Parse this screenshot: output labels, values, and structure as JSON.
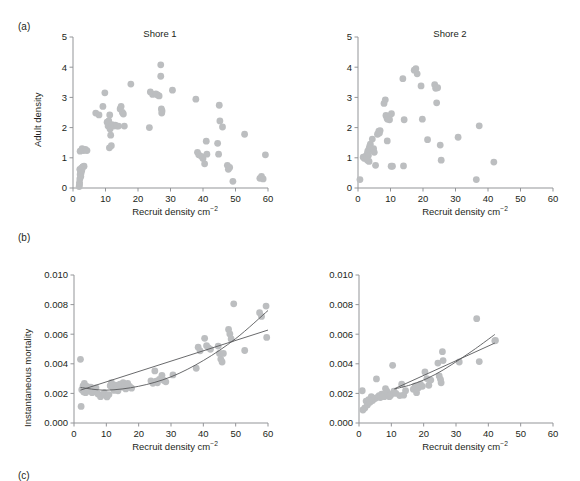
{
  "figure": {
    "panel_a_letter": "(a)",
    "panel_b_letter": "(b)",
    "panel_c_letter": "(c)"
  },
  "labels": {
    "title_shore1": "Shore 1",
    "title_shore2": "Shore 2",
    "xlabel": "Recruit density cm",
    "xlabel_sup": "−2",
    "ylabel_top": "Adult density",
    "ylabel_bottom": "Instantaneous mortality"
  },
  "colors": {
    "point": "#bcbec0",
    "axis": "#939598",
    "line": "#58595b",
    "text": "#231f20",
    "background": "#ffffff"
  },
  "chart_data": [
    {
      "id": "a-shore1",
      "type": "scatter",
      "title": "Shore 1",
      "xlabel": "Recruit density cm−2",
      "ylabel": "Adult density",
      "xlim": [
        0,
        60
      ],
      "ylim": [
        0,
        5
      ],
      "xticks": [
        0,
        10,
        20,
        30,
        40,
        50,
        60
      ],
      "yticks": [
        0,
        1,
        2,
        3,
        4,
        5
      ],
      "grid": false,
      "legend": "none",
      "points": [
        [
          1.9,
          0.05
        ],
        [
          2.0,
          0.18
        ],
        [
          2.1,
          0.3
        ],
        [
          2.2,
          0.45
        ],
        [
          2.3,
          0.55
        ],
        [
          2.1,
          0.62
        ],
        [
          2.6,
          0.66
        ],
        [
          3.0,
          0.7
        ],
        [
          3.4,
          0.72
        ],
        [
          2.5,
          0.5
        ],
        [
          2.0,
          0.12
        ],
        [
          2.4,
          0.38
        ],
        [
          2.7,
          0.58
        ],
        [
          3.1,
          0.7
        ],
        [
          2.2,
          1.22
        ],
        [
          2.8,
          1.3
        ],
        [
          3.3,
          1.24
        ],
        [
          3.8,
          1.28
        ],
        [
          4.3,
          1.24
        ],
        [
          7.0,
          2.48
        ],
        [
          8.0,
          2.42
        ],
        [
          9.2,
          2.7
        ],
        [
          9.8,
          3.15
        ],
        [
          10.5,
          2.18
        ],
        [
          10.8,
          2.05
        ],
        [
          11.0,
          2.22
        ],
        [
          11.3,
          2.42
        ],
        [
          11.4,
          1.95
        ],
        [
          11.6,
          1.75
        ],
        [
          11.2,
          1.33
        ],
        [
          11.8,
          1.4
        ],
        [
          12.0,
          2.1
        ],
        [
          12.5,
          2.05
        ],
        [
          13.0,
          2.08
        ],
        [
          13.5,
          2.05
        ],
        [
          14.0,
          2.05
        ],
        [
          14.5,
          2.62
        ],
        [
          14.8,
          2.7
        ],
        [
          15.2,
          2.5
        ],
        [
          15.5,
          2.45
        ],
        [
          15.8,
          2.05
        ],
        [
          17.8,
          3.44
        ],
        [
          23.5,
          2.0
        ],
        [
          23.8,
          3.18
        ],
        [
          24.5,
          3.1
        ],
        [
          25.5,
          3.12
        ],
        [
          26.0,
          3.08
        ],
        [
          26.5,
          3.05
        ],
        [
          27.0,
          4.08
        ],
        [
          27.0,
          3.7
        ],
        [
          27.2,
          2.62
        ],
        [
          27.3,
          2.48
        ],
        [
          27.4,
          2.55
        ],
        [
          30.6,
          3.24
        ],
        [
          37.8,
          2.94
        ],
        [
          38.3,
          1.18
        ],
        [
          38.7,
          1.1
        ],
        [
          39.5,
          1.05
        ],
        [
          40.0,
          0.98
        ],
        [
          40.5,
          0.8
        ],
        [
          41.0,
          1.55
        ],
        [
          41.2,
          1.12
        ],
        [
          44.5,
          1.48
        ],
        [
          44.8,
          1.12
        ],
        [
          45.0,
          2.74
        ],
        [
          45.2,
          2.22
        ],
        [
          46.0,
          2.02
        ],
        [
          47.5,
          0.75
        ],
        [
          47.8,
          0.62
        ],
        [
          48.2,
          0.68
        ],
        [
          49.2,
          0.22
        ],
        [
          52.8,
          1.78
        ],
        [
          57.5,
          0.32
        ],
        [
          58.0,
          0.38
        ],
        [
          58.5,
          0.3
        ],
        [
          59.2,
          1.1
        ]
      ],
      "fit_lines": []
    },
    {
      "id": "a-shore2",
      "type": "scatter",
      "title": "Shore 2",
      "xlabel": "Recruit density cm−2",
      "ylabel": "Adult density",
      "xlim": [
        0,
        60
      ],
      "ylim": [
        0,
        5
      ],
      "xticks": [
        0,
        10,
        20,
        30,
        40,
        50,
        60
      ],
      "yticks": [
        0,
        1,
        2,
        3,
        4,
        5
      ],
      "grid": false,
      "legend": "none",
      "points": [
        [
          0.6,
          0.28
        ],
        [
          1.6,
          1.02
        ],
        [
          2.0,
          0.98
        ],
        [
          2.3,
          1.05
        ],
        [
          2.6,
          1.0
        ],
        [
          2.8,
          1.12
        ],
        [
          3.0,
          1.22
        ],
        [
          3.2,
          1.08
        ],
        [
          3.4,
          1.3
        ],
        [
          3.6,
          1.38
        ],
        [
          3.8,
          1.45
        ],
        [
          3.4,
          0.88
        ],
        [
          2.9,
          0.92
        ],
        [
          4.4,
          1.62
        ],
        [
          4.8,
          1.3
        ],
        [
          5.0,
          1.18
        ],
        [
          5.4,
          0.75
        ],
        [
          6.0,
          1.78
        ],
        [
          6.4,
          1.88
        ],
        [
          6.8,
          1.9
        ],
        [
          6.6,
          1.82
        ],
        [
          8.0,
          2.8
        ],
        [
          8.4,
          2.92
        ],
        [
          8.6,
          2.4
        ],
        [
          8.9,
          2.32
        ],
        [
          9.1,
          2.28
        ],
        [
          9.3,
          2.38
        ],
        [
          9.5,
          2.34
        ],
        [
          9.7,
          2.26
        ],
        [
          9.0,
          1.56
        ],
        [
          10.3,
          2.46
        ],
        [
          10.6,
          0.72
        ],
        [
          10.2,
          0.72
        ],
        [
          13.8,
          3.62
        ],
        [
          14.2,
          2.26
        ],
        [
          14.0,
          0.73
        ],
        [
          17.3,
          3.9
        ],
        [
          17.8,
          3.95
        ],
        [
          18.2,
          3.78
        ],
        [
          19.4,
          3.38
        ],
        [
          19.8,
          2.28
        ],
        [
          21.4,
          1.6
        ],
        [
          23.6,
          3.42
        ],
        [
          23.9,
          3.3
        ],
        [
          24.2,
          2.82
        ],
        [
          24.5,
          3.32
        ],
        [
          25.3,
          1.42
        ],
        [
          25.6,
          0.92
        ],
        [
          30.8,
          1.68
        ],
        [
          36.4,
          0.28
        ],
        [
          37.3,
          2.06
        ],
        [
          41.8,
          0.86
        ]
      ],
      "fit_lines": []
    },
    {
      "id": "b-shore1",
      "type": "scatter",
      "title": "",
      "xlabel": "Recruit density cm−2",
      "ylabel": "Instantaneous mortality",
      "xlim": [
        0,
        60
      ],
      "ylim": [
        0.0,
        0.01
      ],
      "xticks": [
        0,
        10,
        20,
        30,
        40,
        50,
        60
      ],
      "yticks": [
        0.0,
        0.002,
        0.004,
        0.006,
        0.008,
        0.01
      ],
      "ytick_labels": [
        "0.000",
        "0.002",
        "0.004",
        "0.006",
        "0.008",
        "0.010"
      ],
      "grid": false,
      "legend": "none",
      "points": [
        [
          2.0,
          0.0043
        ],
        [
          2.2,
          0.00112
        ],
        [
          2.4,
          0.00225
        ],
        [
          2.8,
          0.0025
        ],
        [
          3.0,
          0.0021
        ],
        [
          3.2,
          0.00268
        ],
        [
          3.4,
          0.00238
        ],
        [
          3.6,
          0.00205
        ],
        [
          3.8,
          0.00222
        ],
        [
          4.0,
          0.00248
        ],
        [
          4.4,
          0.0023
        ],
        [
          4.8,
          0.00218
        ],
        [
          5.2,
          0.00243
        ],
        [
          5.6,
          0.00205
        ],
        [
          6.2,
          0.00225
        ],
        [
          6.8,
          0.00238
        ],
        [
          7.4,
          0.00196
        ],
        [
          8.2,
          0.00178
        ],
        [
          8.8,
          0.00192
        ],
        [
          9.4,
          0.00205
        ],
        [
          10.2,
          0.00176
        ],
        [
          10.8,
          0.00192
        ],
        [
          11.2,
          0.00252
        ],
        [
          11.6,
          0.00272
        ],
        [
          12.0,
          0.00238
        ],
        [
          12.4,
          0.0022
        ],
        [
          12.8,
          0.00255
        ],
        [
          13.2,
          0.00232
        ],
        [
          13.6,
          0.00218
        ],
        [
          14.2,
          0.00262
        ],
        [
          14.8,
          0.00242
        ],
        [
          15.2,
          0.00272
        ],
        [
          15.6,
          0.00252
        ],
        [
          16.0,
          0.0023
        ],
        [
          16.6,
          0.00268
        ],
        [
          17.2,
          0.00248
        ],
        [
          17.8,
          0.00235
        ],
        [
          23.8,
          0.00285
        ],
        [
          24.4,
          0.00268
        ],
        [
          25.0,
          0.00352
        ],
        [
          25.4,
          0.00282
        ],
        [
          25.8,
          0.00272
        ],
        [
          26.4,
          0.00295
        ],
        [
          27.2,
          0.00322
        ],
        [
          27.8,
          0.00288
        ],
        [
          28.4,
          0.00278
        ],
        [
          30.6,
          0.00325
        ],
        [
          37.8,
          0.0037
        ],
        [
          38.4,
          0.00512
        ],
        [
          39.0,
          0.00488
        ],
        [
          40.4,
          0.00572
        ],
        [
          41.0,
          0.00522
        ],
        [
          41.6,
          0.00508
        ],
        [
          42.2,
          0.00498
        ],
        [
          44.6,
          0.0052
        ],
        [
          45.0,
          0.0047
        ],
        [
          45.4,
          0.00432
        ],
        [
          45.8,
          0.00412
        ],
        [
          46.2,
          0.0047
        ],
        [
          47.8,
          0.00632
        ],
        [
          48.2,
          0.00602
        ],
        [
          48.6,
          0.00568
        ],
        [
          49.4,
          0.00805
        ],
        [
          52.8,
          0.0049
        ],
        [
          57.4,
          0.00745
        ],
        [
          58.0,
          0.0072
        ],
        [
          59.4,
          0.0079
        ],
        [
          59.6,
          0.00578
        ]
      ],
      "fit_lines": [
        {
          "name": "linear-fit",
          "type": "line",
          "x": [
            2,
            60
          ],
          "y": [
            0.00222,
            0.00628
          ]
        },
        {
          "name": "curve-fit",
          "type": "curve",
          "x": [
            2,
            10,
            20,
            30,
            40,
            50,
            60
          ],
          "y": [
            0.0024,
            0.00222,
            0.00248,
            0.00312,
            0.00422,
            0.0057,
            0.0076
          ]
        }
      ]
    },
    {
      "id": "b-shore2",
      "type": "scatter",
      "title": "",
      "xlabel": "Recruit density cm−2",
      "ylabel": "Instantaneous mortality",
      "xlim": [
        0,
        60
      ],
      "ylim": [
        0.0,
        0.01
      ],
      "xticks": [
        0,
        10,
        20,
        30,
        40,
        50,
        60
      ],
      "yticks": [
        0.0,
        0.002,
        0.004,
        0.006,
        0.008,
        0.01
      ],
      "ytick_labels": [
        "0.000",
        "0.002",
        "0.004",
        "0.006",
        "0.008",
        "0.010"
      ],
      "grid": false,
      "legend": "none",
      "points": [
        [
          1.0,
          0.00218
        ],
        [
          1.2,
          0.00088
        ],
        [
          1.8,
          0.00102
        ],
        [
          2.2,
          0.00148
        ],
        [
          2.6,
          0.00122
        ],
        [
          3.0,
          0.00158
        ],
        [
          3.4,
          0.0014
        ],
        [
          3.8,
          0.00178
        ],
        [
          4.2,
          0.00152
        ],
        [
          4.6,
          0.00168
        ],
        [
          5.0,
          0.00165
        ],
        [
          5.4,
          0.00298
        ],
        [
          5.8,
          0.00175
        ],
        [
          6.2,
          0.00185
        ],
        [
          6.6,
          0.00172
        ],
        [
          7.0,
          0.00195
        ],
        [
          7.4,
          0.00185
        ],
        [
          7.8,
          0.00178
        ],
        [
          8.2,
          0.00232
        ],
        [
          8.6,
          0.00215
        ],
        [
          9.0,
          0.002
        ],
        [
          9.4,
          0.00178
        ],
        [
          9.8,
          0.00188
        ],
        [
          10.4,
          0.0039
        ],
        [
          10.8,
          0.00215
        ],
        [
          11.4,
          0.002
        ],
        [
          12.6,
          0.00185
        ],
        [
          13.2,
          0.00262
        ],
        [
          13.8,
          0.00188
        ],
        [
          14.4,
          0.00218
        ],
        [
          16.8,
          0.00228
        ],
        [
          17.4,
          0.0025
        ],
        [
          17.8,
          0.00205
        ],
        [
          18.4,
          0.00238
        ],
        [
          19.0,
          0.00262
        ],
        [
          19.6,
          0.00248
        ],
        [
          20.4,
          0.00345
        ],
        [
          21.0,
          0.003
        ],
        [
          21.6,
          0.00255
        ],
        [
          22.2,
          0.0029
        ],
        [
          24.4,
          0.00405
        ],
        [
          24.8,
          0.00318
        ],
        [
          25.2,
          0.00295
        ],
        [
          25.4,
          0.00272
        ],
        [
          25.8,
          0.00482
        ],
        [
          26.0,
          0.00422
        ],
        [
          31.0,
          0.00412
        ],
        [
          36.4,
          0.00705
        ],
        [
          37.2,
          0.00415
        ],
        [
          42.0,
          0.00555
        ],
        [
          42.2,
          0.00558
        ]
      ],
      "fit_lines": [
        {
          "name": "linear-fit",
          "type": "line",
          "x": [
            11,
            42
          ],
          "y": [
            0.00232,
            0.0054
          ]
        },
        {
          "name": "curve-fit",
          "type": "curve",
          "x": [
            11,
            16,
            21,
            26,
            31,
            36,
            42
          ],
          "y": [
            0.0023,
            0.00258,
            0.003,
            0.00358,
            0.00428,
            0.00502,
            0.00598
          ]
        }
      ]
    }
  ]
}
